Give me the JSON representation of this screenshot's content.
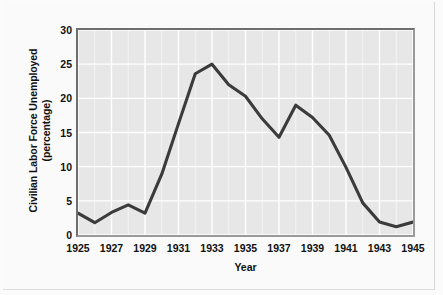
{
  "chart_data": {
    "type": "line",
    "title": "",
    "xlabel": "Year",
    "ylabel": "Civilian Labor Force Unemployed (percentage)",
    "ylabel_line1": "Civilian Labor Force Unemployed",
    "ylabel_line2": "(percentage)",
    "x": [
      1925,
      1926,
      1927,
      1928,
      1929,
      1930,
      1931,
      1932,
      1933,
      1934,
      1935,
      1936,
      1937,
      1938,
      1939,
      1940,
      1941,
      1942,
      1943,
      1944,
      1945
    ],
    "values": [
      3.2,
      1.8,
      3.3,
      4.4,
      3.2,
      8.9,
      16.3,
      23.6,
      25.0,
      22.0,
      20.3,
      17.0,
      14.3,
      19.0,
      17.2,
      14.6,
      9.9,
      4.7,
      1.9,
      1.2,
      1.9
    ],
    "xlim": [
      1925,
      1945
    ],
    "ylim": [
      0,
      30
    ],
    "ytick_labels": [
      "0",
      "5",
      "10",
      "15",
      "20",
      "25",
      "30"
    ],
    "ytick_values": [
      0,
      5,
      10,
      15,
      20,
      25,
      30
    ],
    "xtick_labels": [
      "1925",
      "1927",
      "1929",
      "1931",
      "1933",
      "1935",
      "1937",
      "1939",
      "1941",
      "1943",
      "1945"
    ],
    "xtick_values": [
      1925,
      1927,
      1929,
      1931,
      1933,
      1935,
      1937,
      1939,
      1941,
      1943,
      1945
    ],
    "grid": true,
    "legend": false,
    "series": [
      {
        "name": "Civilian Labor Force Unemployed",
        "values": [
          3.2,
          1.8,
          3.3,
          4.4,
          3.2,
          8.9,
          16.3,
          23.6,
          25.0,
          22.0,
          20.3,
          17.0,
          14.3,
          19.0,
          17.2,
          14.6,
          9.9,
          4.7,
          1.9,
          1.2,
          1.9
        ]
      }
    ]
  },
  "colors": {
    "line": "#3b3b3b",
    "plot_background": "#e7e7e7",
    "gridline": "#ffffff",
    "axis": "#6e6e6e",
    "text": "#111111",
    "page_background": "#fafafa"
  }
}
